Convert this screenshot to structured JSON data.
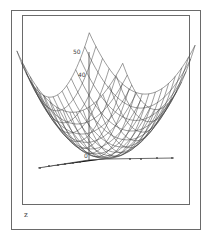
{
  "figure": {
    "caption": "z"
  },
  "chart_data": {
    "type": "surface3d",
    "title": "",
    "function": "z = x^2 + y^2 (paraboloid wireframe)",
    "z_axis": {
      "ticks": [
        40,
        50
      ],
      "tick_labels": [
        "40",
        "50"
      ],
      "range": [
        0,
        50
      ]
    },
    "x_axis": {
      "tick_labels": [
        "-4",
        "-3",
        "-2",
        "-1",
        "0",
        "1",
        "2",
        "3",
        "4"
      ],
      "range": [
        -5,
        5
      ]
    },
    "y_axis": {
      "tick_labels": [
        "1",
        "2",
        "3",
        "4",
        "5"
      ]
    },
    "style": {
      "mesh": "wireframe",
      "line_color": "#333333",
      "grid": false,
      "legend": false
    }
  },
  "ticks": {
    "z50": "50",
    "z40": "40",
    "zero": "0"
  }
}
